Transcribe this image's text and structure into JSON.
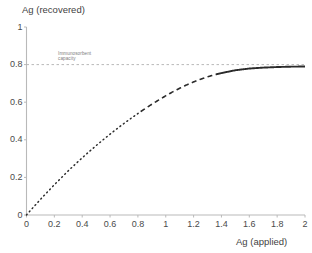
{
  "figure": {
    "top_bleed_text": "˙ ˙ ˙",
    "background": "#ffffff",
    "axis_color": "#b9b9b9",
    "curve_color": "#2b2b2b",
    "reference_line_color": "#b0b0b0"
  },
  "chart_data": {
    "type": "line",
    "title": "",
    "xlabel": "Ag (applied)",
    "ylabel": "Ag (recovered)",
    "xlim": [
      0,
      2
    ],
    "ylim": [
      0,
      1
    ],
    "grid": false,
    "legend": "none",
    "xticks": [
      "0",
      "0.2",
      "0.4",
      "0.6",
      "0.8",
      "1",
      "1.2",
      "1.4",
      "1.6",
      "1.8",
      "2"
    ],
    "xtick_values": [
      0,
      0.2,
      0.4,
      0.6,
      0.8,
      1,
      1.2,
      1.4,
      1.6,
      1.8,
      2
    ],
    "yticks": [
      "0",
      "0.2",
      "0.4",
      "0.6",
      "0.8",
      "1"
    ],
    "ytick_values": [
      0,
      0.2,
      0.4,
      0.6,
      0.8,
      1
    ],
    "annotations": [
      {
        "name": "immunosorbent-capacity",
        "line1": "Immunosorbent",
        "line2": "capacity",
        "y_value": 0.8,
        "style": "dashed-horizontal-reference-line"
      }
    ],
    "series": [
      {
        "name": "Ag recovered vs Ag applied",
        "plateau": 0.79,
        "segments": [
          {
            "style": "dotted",
            "x_from": 0.0,
            "x_to": 0.82
          },
          {
            "style": "dashed",
            "x_from": 0.82,
            "x_to": 1.36
          },
          {
            "style": "solid",
            "x_from": 1.36,
            "x_to": 2.0
          }
        ],
        "x": [
          0.0,
          0.05,
          0.1,
          0.15,
          0.2,
          0.25,
          0.3,
          0.35,
          0.4,
          0.45,
          0.5,
          0.55,
          0.6,
          0.65,
          0.7,
          0.75,
          0.8,
          0.85,
          0.9,
          0.95,
          1.0,
          1.05,
          1.1,
          1.15,
          1.2,
          1.25,
          1.3,
          1.35,
          1.4,
          1.5,
          1.6,
          1.7,
          1.8,
          1.9,
          2.0
        ],
        "y": [
          0.0,
          0.042,
          0.083,
          0.122,
          0.161,
          0.198,
          0.235,
          0.27,
          0.304,
          0.337,
          0.369,
          0.4,
          0.43,
          0.459,
          0.487,
          0.514,
          0.54,
          0.565,
          0.589,
          0.612,
          0.634,
          0.655,
          0.674,
          0.692,
          0.708,
          0.722,
          0.735,
          0.746,
          0.755,
          0.77,
          0.779,
          0.784,
          0.787,
          0.789,
          0.79
        ]
      }
    ]
  }
}
